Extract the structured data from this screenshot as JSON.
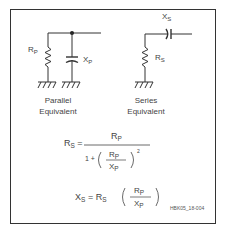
{
  "diagram": {
    "parallel": {
      "resistor_label": "R",
      "resistor_sub": "P",
      "reactance_label": "X",
      "reactance_sub": "P",
      "caption_line1": "Parallel",
      "caption_line2": "Equivalent"
    },
    "series": {
      "reactance_label": "X",
      "reactance_sub": "S",
      "resistor_label": "R",
      "resistor_sub": "S",
      "caption_line1": "Series",
      "caption_line2": "Equivalent"
    },
    "equation1": {
      "lhs": "R",
      "lhs_sub": "S",
      "equals": "=",
      "numerator": "R",
      "numerator_sub": "P",
      "denom_prefix": "1 +",
      "inner_num": "R",
      "inner_num_sub": "P",
      "inner_den": "X",
      "inner_den_sub": "P",
      "exponent": "2"
    },
    "equation2": {
      "lhs": "X",
      "lhs_sub": "S",
      "equals": "= R",
      "rs_sub": "S",
      "inner_num": "R",
      "inner_num_sub": "P",
      "inner_den": "X",
      "inner_den_sub": "P"
    },
    "figure_id": "HBK05_18-004"
  }
}
